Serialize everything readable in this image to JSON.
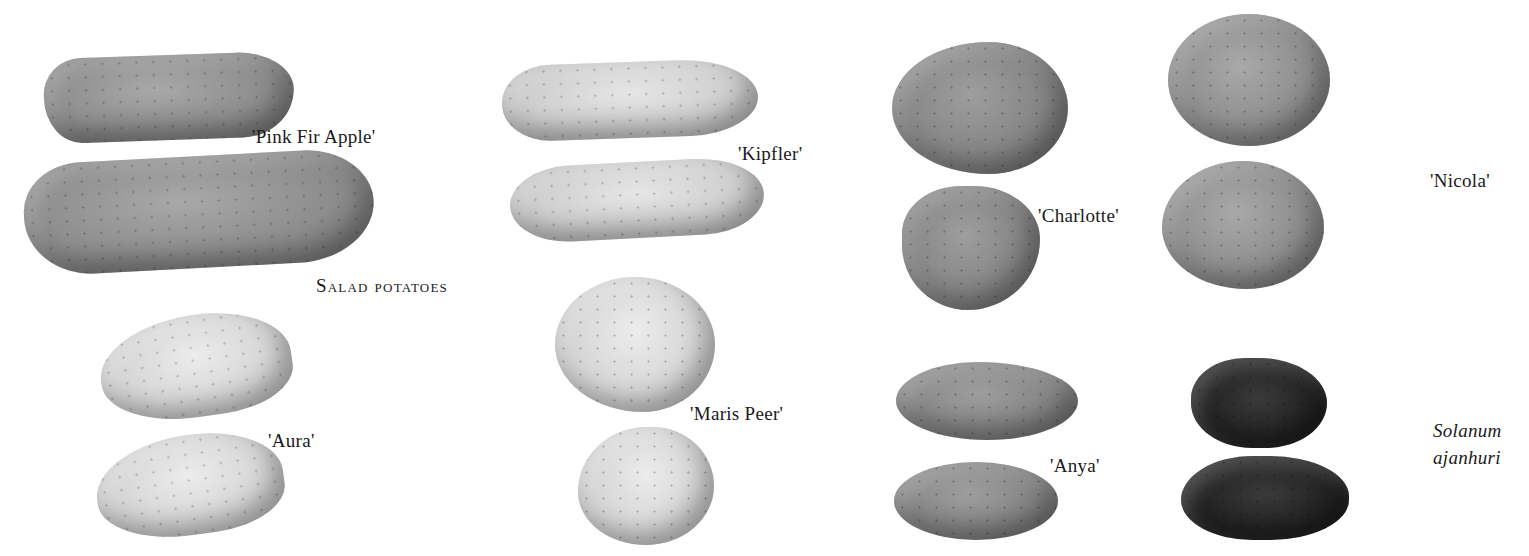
{
  "section_heading": "Salad potatoes",
  "varieties": [
    {
      "id": "pink-fir-apple",
      "label": "'Pink Fir Apple'"
    },
    {
      "id": "kipfler",
      "label": "'Kipfler'"
    },
    {
      "id": "charlotte",
      "label": "'Charlotte'"
    },
    {
      "id": "nicola",
      "label": "'Nicola'"
    },
    {
      "id": "aura",
      "label": "'Aura'"
    },
    {
      "id": "maris-peer",
      "label": "'Maris Peer'"
    },
    {
      "id": "anya",
      "label": "'Anya'"
    },
    {
      "id": "solanum-ajanhuri",
      "label_line1": "Solanum",
      "label_line2": "ajanhuri"
    }
  ],
  "colors": {
    "background": "#ffffff",
    "text": "#1a1a1a"
  }
}
